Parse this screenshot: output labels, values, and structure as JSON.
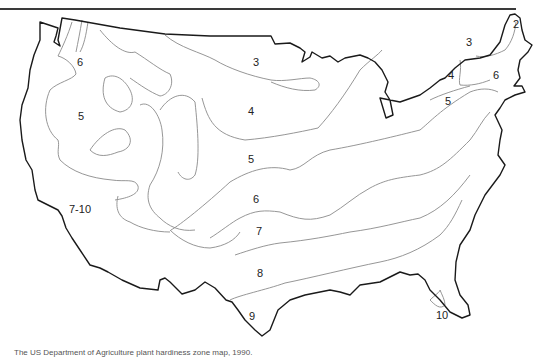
{
  "map": {
    "title": "USDA plant hardiness zone map",
    "outline_color": "#1a1a1a",
    "contour_color": "#8a8a8a",
    "zone_labels": [
      {
        "text": "2",
        "x": 516,
        "y": 24
      },
      {
        "text": "3",
        "x": 469,
        "y": 42
      },
      {
        "text": "3",
        "x": 256,
        "y": 62
      },
      {
        "text": "6",
        "x": 80,
        "y": 62
      },
      {
        "text": "4",
        "x": 451,
        "y": 75
      },
      {
        "text": "6",
        "x": 496,
        "y": 75
      },
      {
        "text": "4",
        "x": 251,
        "y": 111
      },
      {
        "text": "5",
        "x": 81,
        "y": 116
      },
      {
        "text": "5",
        "x": 448,
        "y": 101
      },
      {
        "text": "5",
        "x": 251,
        "y": 159
      },
      {
        "text": "6",
        "x": 256,
        "y": 199
      },
      {
        "text": "7-10",
        "x": 80,
        "y": 209
      },
      {
        "text": "7",
        "x": 259,
        "y": 231
      },
      {
        "text": "8",
        "x": 260,
        "y": 273
      },
      {
        "text": "9",
        "x": 252,
        "y": 316
      },
      {
        "text": "10",
        "x": 442,
        "y": 315
      }
    ]
  },
  "caption": "The US Department of Agriculture plant hardiness zone map, 1990."
}
